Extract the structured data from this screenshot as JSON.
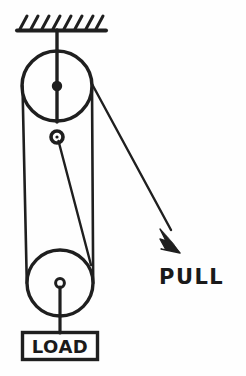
{
  "diagram": {
    "background_color": "#fefefe",
    "ink_color": "#1f1f1f",
    "labels": {
      "pull": "PULL",
      "load": "LOAD"
    },
    "components": {
      "ceiling": "hatched-ceiling-support",
      "upper_pulley": "upper-fixed-pulley",
      "idler_pulley": "small-idler-pulley",
      "lower_pulley": "lower-movable-pulley",
      "load_box": "load-block",
      "pull_arrow": "pull-force-arrow",
      "rope": "rope-path"
    },
    "geometry": {
      "ceiling_line": {
        "x1": 17,
        "y1": 30,
        "x2": 105,
        "y2": 30
      },
      "hatch_count": 8,
      "support_rod": {
        "x1": 57,
        "y1": 30,
        "x2": 57,
        "y2": 86
      },
      "upper_pulley": {
        "cx": 57,
        "cy": 86,
        "r": 35
      },
      "upper_hub": {
        "cx": 57,
        "cy": 86,
        "r": 4
      },
      "idler_pulley": {
        "cx": 57,
        "cy": 137,
        "r": 6
      },
      "lower_pulley": {
        "cx": 60,
        "cy": 283,
        "r": 33
      },
      "lower_hub": {
        "cx": 60,
        "cy": 283,
        "r": 4
      },
      "load_rod": {
        "x1": 60,
        "y1": 287,
        "x2": 60,
        "y2": 333
      },
      "load_box": {
        "x": 22,
        "y": 332,
        "w": 76,
        "h": 28
      },
      "rope_left": {
        "x1": 23,
        "y1": 86,
        "x2": 27,
        "y2": 283
      },
      "rope_right": {
        "x1": 92,
        "y1": 86,
        "x2": 93,
        "y2": 283
      },
      "rope_idler_to_lower": {
        "x1": 58,
        "y1": 140,
        "x2": 91,
        "y2": 264
      },
      "pull_line": {
        "x1": 92,
        "y1": 84,
        "x2": 172,
        "y2": 232
      },
      "arrow_tip": {
        "x": 179,
        "y": 252
      },
      "pull_label_pos": {
        "x": 160,
        "y": 285
      },
      "load_label_pos": {
        "x": 60,
        "y": 354
      }
    }
  }
}
